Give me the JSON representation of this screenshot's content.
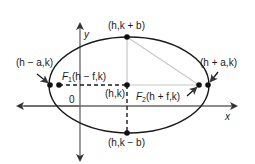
{
  "diagram": {
    "axes": {
      "x_label": "x",
      "y_label": "y",
      "origin_label": "0"
    },
    "points": {
      "center": "(h,k)",
      "top_vertex": "(h,k + b)",
      "bottom_vertex": "(h,k − b)",
      "left_vertex": "(h − a,k)",
      "right_vertex": "(h + a,k)",
      "focus1_name": "F",
      "focus1_sub": "1",
      "focus1_coords": "(h − f,k)",
      "focus2_name": "F",
      "focus2_sub": "2",
      "focus2_coords": "(h + f,k)"
    },
    "colors": {
      "ink": "#1a1a1a",
      "light_line": "#c8c8c8",
      "background": "#ffffff"
    }
  }
}
